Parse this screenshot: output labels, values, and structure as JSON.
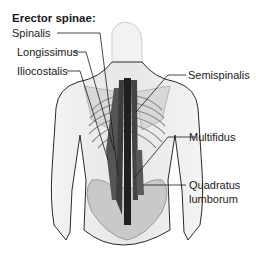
{
  "diagram": {
    "title": "Erector spinae:",
    "labels": {
      "spinalis": "Spinalis",
      "longissimus": "Longissimus",
      "iliocostalis": "Iliocostalis",
      "semispinalis": "Semispinalis",
      "multifidus": "Multifidus",
      "quadratus_line1": "Quadratus",
      "quadratus_line2": "lumborum"
    }
  }
}
